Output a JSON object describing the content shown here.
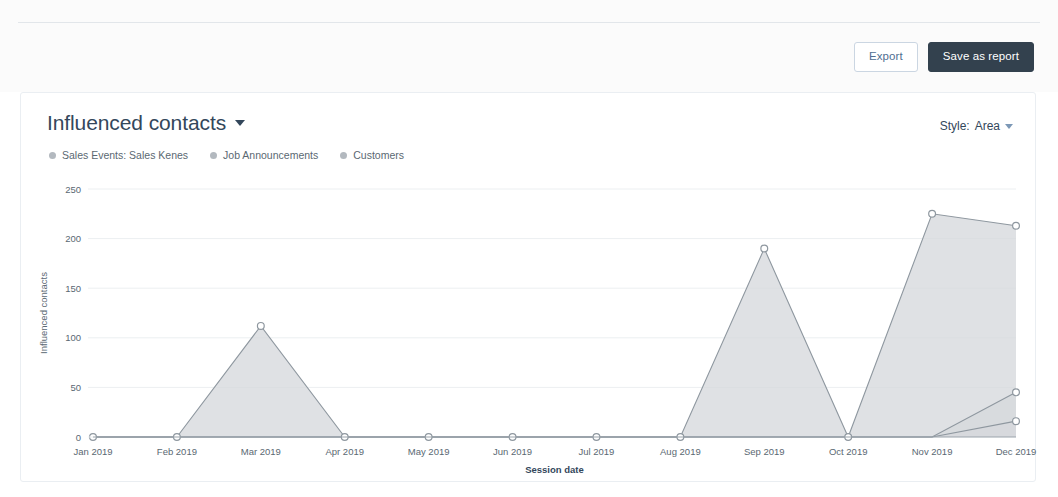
{
  "toolbar": {
    "export_label": "Export",
    "save_label": "Save as report"
  },
  "card": {
    "title": "Influenced contacts",
    "title_caret_icon": "caret-down-icon",
    "style": {
      "label": "Style:",
      "value": "Area",
      "caret_icon": "caret-down-icon"
    }
  },
  "legend": {
    "items": [
      {
        "label": "Sales Events: Sales Kenes",
        "color": "#b3b9bf"
      },
      {
        "label": "Job Announcements",
        "color": "#b3b9bf"
      },
      {
        "label": "Customers",
        "color": "#b3b9bf"
      }
    ]
  },
  "chart_data": {
    "type": "area",
    "title": "Influenced contacts",
    "xlabel": "Session date",
    "ylabel": "Influenced contacts",
    "categories": [
      "Jan 2019",
      "Feb 2019",
      "Mar 2019",
      "Apr 2019",
      "May 2019",
      "Jun 2019",
      "Jul 2019",
      "Aug 2019",
      "Sep 2019",
      "Oct 2019",
      "Nov 2019",
      "Dec 2019"
    ],
    "ylim": [
      0,
      250
    ],
    "yticks": [
      0,
      50,
      100,
      150,
      200,
      250
    ],
    "grid": true,
    "legend_position": "top-left",
    "series": [
      {
        "name": "Sales Events: Sales Kenes",
        "values": [
          0,
          0,
          112,
          0,
          0,
          0,
          0,
          0,
          190,
          0,
          225,
          213
        ]
      },
      {
        "name": "Job Announcements",
        "values": [
          0,
          0,
          0,
          0,
          0,
          0,
          0,
          0,
          0,
          0,
          0,
          45
        ]
      },
      {
        "name": "Customers",
        "values": [
          0,
          0,
          0,
          0,
          0,
          0,
          0,
          0,
          0,
          0,
          0,
          16
        ]
      }
    ]
  }
}
